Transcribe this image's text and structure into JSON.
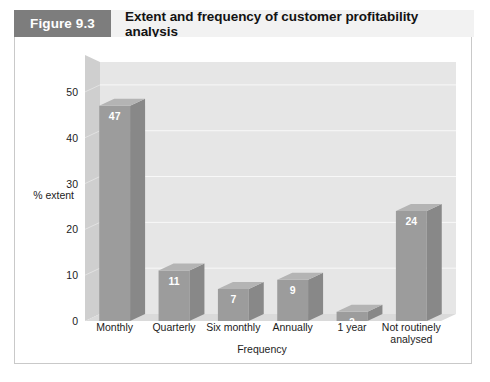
{
  "figure": {
    "number": "Figure 9.3",
    "title": "Extent and frequency of customer profitability analysis"
  },
  "colors": {
    "header_band": "#f2f2f2",
    "number_box": "#7d7d7d",
    "number_text": "#ffffff",
    "title_text": "#131313",
    "frame_border": "#c9c9c9",
    "wall_back": "#e6e6e6",
    "wall_left": "#cccccc",
    "floor": "#d8d8d8",
    "gridline": "#f7f7f7",
    "bar_front": "#9c9c9c",
    "bar_side": "#888888",
    "bar_top": "#b4b4b4",
    "value_text": "#ffffff",
    "axis_text": "#1c1c1c"
  },
  "chart_data": {
    "type": "bar",
    "title": "Extent and frequency of customer profitability analysis",
    "xlabel": "Frequency",
    "ylabel": "% extent",
    "categories": [
      "Monthly",
      "Quarterly",
      "Six monthly",
      "Annually",
      "1 year",
      "Not routinely analysed"
    ],
    "values": [
      47,
      11,
      7,
      9,
      2,
      24
    ],
    "value_labels": [
      "47",
      "11",
      "7",
      "9",
      "2",
      "24"
    ],
    "ylim": [
      0,
      55
    ],
    "yticks": [
      0,
      10,
      20,
      30,
      40,
      50
    ],
    "ytick_labels": [
      "0",
      "10",
      "20",
      "30",
      "40",
      "50"
    ],
    "grid": true,
    "legend": false,
    "style": "3d-column"
  }
}
